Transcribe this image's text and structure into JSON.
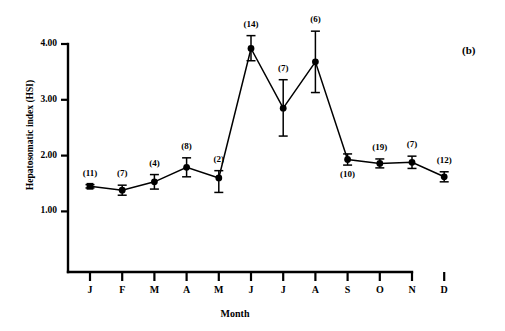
{
  "figure": {
    "panel_label": "(b)",
    "y_axis_title": "Hepatosomatic index (HSI)",
    "x_axis_title": "Month"
  },
  "chart_data": {
    "type": "line",
    "title": "",
    "subtitle": "",
    "xlabel": "Month",
    "ylabel": "Hepatosomatic index (HSI)",
    "grid": false,
    "legend": "none",
    "ylim": [
      0.6,
      4.35
    ],
    "xlim": [
      0.4,
      12.6
    ],
    "yticks": [
      "1.00",
      "2.00",
      "3.00",
      "4.00"
    ],
    "ytick_values": [
      1.0,
      2.0,
      3.0,
      4.0
    ],
    "categories": [
      "J",
      "F",
      "M",
      "A",
      "M",
      "J",
      "J",
      "A",
      "S",
      "O",
      "N",
      "D"
    ],
    "category_names": [
      "January",
      "February",
      "March",
      "April",
      "May",
      "June",
      "July",
      "August",
      "September",
      "October",
      "November",
      "December"
    ],
    "series": [
      {
        "name": "Hepatosomatic index (HSI)",
        "marker": "filled-square-circle",
        "values": [
          1.45,
          1.38,
          1.53,
          1.79,
          1.6,
          3.92,
          2.85,
          3.68,
          1.93,
          1.86,
          1.88,
          1.62
        ],
        "err_low": [
          1.42,
          1.29,
          1.4,
          1.62,
          1.34,
          3.7,
          2.35,
          3.13,
          1.83,
          1.78,
          1.77,
          1.53
        ],
        "err_high": [
          1.48,
          1.47,
          1.66,
          1.96,
          1.73,
          4.15,
          3.36,
          4.23,
          2.03,
          1.94,
          1.99,
          1.71
        ]
      }
    ],
    "sample_sizes": [
      "(11)",
      "(7)",
      "(4)",
      "(8)",
      "(2)",
      "(14)",
      "(7)",
      "(6)",
      "(10)",
      "(19)",
      "(7)",
      "(12)"
    ],
    "sample_size_values": [
      11,
      7,
      4,
      8,
      2,
      14,
      7,
      6,
      10,
      19,
      7,
      12
    ],
    "sample_label_position": [
      "above",
      "above",
      "above",
      "above",
      "above",
      "above",
      "above",
      "above",
      "below",
      "above",
      "above",
      "above"
    ],
    "colors": {
      "line": "#000000",
      "marker": "#000000",
      "axis": "#000000",
      "background": "#ffffff"
    }
  }
}
